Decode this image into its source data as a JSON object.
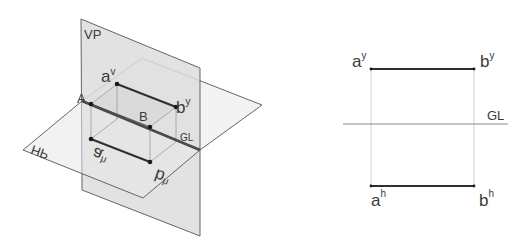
{
  "diagram": {
    "type": "orthographic-projection",
    "pictorial": {
      "planes": {
        "vp_label": "VP",
        "hp_label": "HP",
        "gl_label": "GL"
      },
      "points": {
        "A": {
          "label": "A"
        },
        "B": {
          "label": "B"
        },
        "av": {
          "base": "a",
          "sup": "v"
        },
        "bv": {
          "base": "b",
          "sup": "y"
        },
        "ah": {
          "base": "a",
          "sup": "h"
        },
        "bh": {
          "base": "b",
          "sup": "h"
        }
      }
    },
    "projection": {
      "gl_label": "GL",
      "av": {
        "base": "a",
        "sup": "y"
      },
      "bv": {
        "base": "b",
        "sup": "y"
      },
      "ah": {
        "base": "a",
        "sup": "h"
      },
      "bh": {
        "base": "b",
        "sup": "h"
      }
    },
    "colors": {
      "plane_fill": "#e6e6e6",
      "plane_edge": "#555555",
      "projector": "#9a9a9a",
      "line": "#333333",
      "text": "#3a3a3a"
    }
  }
}
